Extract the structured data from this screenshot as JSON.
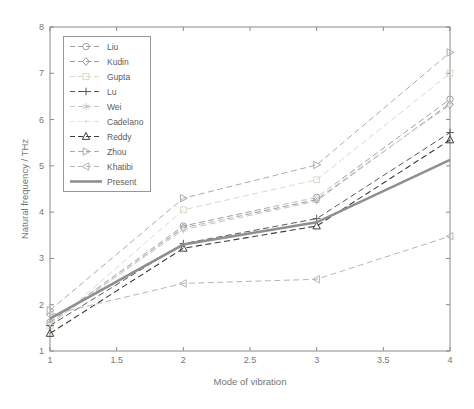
{
  "figure": {
    "xlabel": "Mode of vibration",
    "ylabel": "Natural frequency / THz"
  },
  "chart_data": {
    "type": "line",
    "title": "",
    "xlabel": "Mode of vibration",
    "ylabel": "Natural frequency / THz",
    "x": [
      1,
      2,
      3,
      4
    ],
    "xlim": [
      1,
      4
    ],
    "ylim": [
      1,
      8
    ],
    "x_ticks": [
      "1",
      "1.5",
      "2",
      "2.5",
      "3",
      "3.5",
      "4"
    ],
    "y_ticks": [
      "1",
      "2",
      "3",
      "4",
      "5",
      "6",
      "7",
      "8"
    ],
    "grid": false,
    "box": true,
    "legend_position": "top-left",
    "axis_color": "#8a8a8a",
    "tick_label_color": "#767676",
    "series": [
      {
        "name": "Liu",
        "marker": "circle",
        "line": "dashed",
        "color": "#a0a0a0",
        "width": 1,
        "values": [
          1.62,
          3.7,
          4.32,
          6.44
        ]
      },
      {
        "name": "Kudin",
        "marker": "diamond",
        "line": "dashed",
        "color": "#9b9b9b",
        "width": 1,
        "values": [
          1.58,
          3.66,
          4.27,
          6.33
        ]
      },
      {
        "name": "Gupta",
        "marker": "square",
        "line": "dashed",
        "color": "#dcd8ca",
        "width": 1,
        "values": [
          1.55,
          4.05,
          4.7,
          7.0
        ]
      },
      {
        "name": "Lu",
        "marker": "plus",
        "line": "dashed",
        "color": "#585858",
        "width": 1,
        "values": [
          1.55,
          3.32,
          3.86,
          5.72
        ]
      },
      {
        "name": "Wei",
        "marker": "asterisk",
        "line": "dashed",
        "color": "#c4c4c4",
        "width": 1,
        "values": [
          1.6,
          3.62,
          4.24,
          6.36
        ]
      },
      {
        "name": "Cadelano",
        "marker": "dot",
        "line": "dashed",
        "color": "#e6e3d6",
        "width": 1,
        "values": [
          1.58,
          3.64,
          4.33,
          6.3
        ]
      },
      {
        "name": "Reddy",
        "marker": "triangle-up",
        "line": "dashed",
        "color": "#3d3d3d",
        "width": 1.1,
        "values": [
          1.38,
          3.22,
          3.7,
          5.56
        ]
      },
      {
        "name": "Zhou",
        "marker": "triangle-right",
        "line": "dashed",
        "color": "#ababab",
        "width": 1,
        "values": [
          1.88,
          4.3,
          5.02,
          7.45
        ]
      },
      {
        "name": "Khatibi",
        "marker": "triangle-left",
        "line": "dashed",
        "color": "#b5b5b5",
        "width": 1,
        "values": [
          1.78,
          2.46,
          2.55,
          3.48
        ]
      },
      {
        "name": "Present",
        "marker": "none",
        "line": "solid",
        "color": "#8f8f8f",
        "width": 2.6,
        "values": [
          1.7,
          3.3,
          3.78,
          5.13
        ]
      }
    ]
  }
}
